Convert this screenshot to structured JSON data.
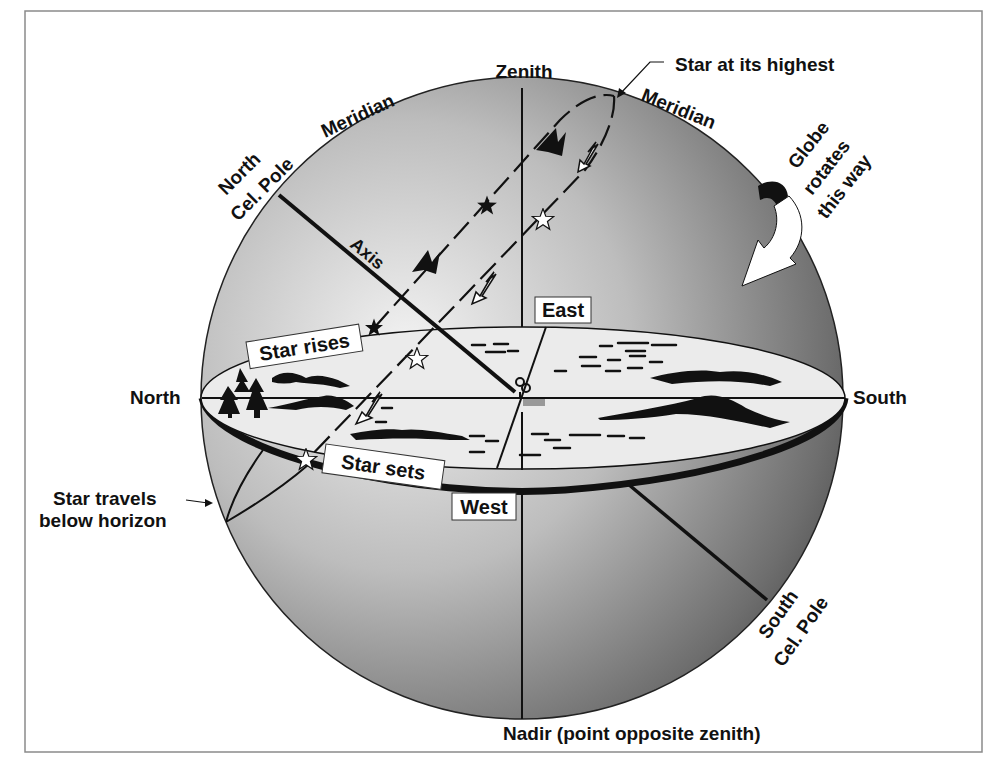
{
  "colors": {
    "globe_light": "#e6e6e6",
    "globe_dark": "#5a5a5a",
    "horizon_plane": "#ececec",
    "ink": "#111111",
    "frame": "#888888"
  },
  "labels": {
    "zenith": "Zenith",
    "nadir": "Nadir (point opposite zenith)",
    "north": "North",
    "south": "South",
    "east": "East",
    "west": "West",
    "meridian_left": "Meridian",
    "meridian_right": "Meridian",
    "north_pole_line1": "North",
    "north_pole_line2": "Cel. Pole",
    "south_pole_line1": "South",
    "south_pole_line2": "Cel. Pole",
    "axis": "Axis",
    "star_highest": "Star at its highest",
    "star_rises": "Star rises",
    "star_sets": "Star sets",
    "star_below_line1": "Star travels",
    "star_below_line2": "below horizon",
    "globe_rotates_line1": "Globe",
    "globe_rotates_line2": "rotates",
    "globe_rotates_line3": "this way"
  },
  "icons": {
    "observer": "observer-figure-icon",
    "filled_star": "black-star-icon",
    "hollow_star": "white-star-icon",
    "rotation_arrow": "curved-arrow-icon",
    "trees": "tree-icon",
    "mountains": "mountain-icon"
  }
}
